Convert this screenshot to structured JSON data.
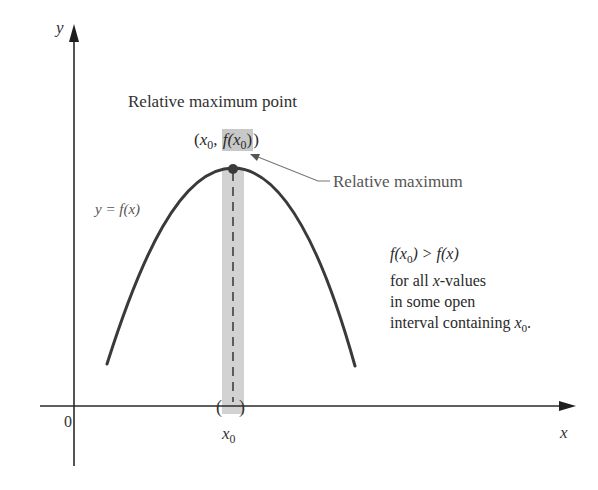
{
  "diagram": {
    "title": "Relative maximum point",
    "point_label": {
      "open": "(",
      "x": "x",
      "x_sub": "0",
      "comma": ",",
      "fx_prefix": "f(x",
      "fx_sub": "0",
      "fx_close": ")",
      "close": ")"
    },
    "annotation": "Relative maximum",
    "function_label": "y = f(x)",
    "condition": {
      "line1_prefix": "f(x",
      "line1_sub": "0",
      "line1_suffix": ") > f(x)",
      "line2_prefix": "for all ",
      "line2_var": "x",
      "line2_suffix": "-values",
      "line3": "in some open",
      "line4_prefix": "interval containing ",
      "line4_var": "x",
      "line4_sub": "0",
      "line4_suffix": "."
    },
    "axes": {
      "x_label": "x",
      "y_label": "y",
      "origin_label": "0",
      "tick_label": "x",
      "tick_sub": "0",
      "interval_marks": "( )"
    },
    "colors": {
      "curve": "#3a3a3a",
      "axis": "#2a2a2a",
      "highlight_band": "#d2d2d2",
      "point_highlight": "#c8c8c8",
      "annotation_arrow": "#777777",
      "annotation_text": "#555555"
    },
    "geometry": {
      "origin_px": [
        74,
        406
      ],
      "peak_px": [
        233,
        168
      ],
      "curve_left_end_px": [
        107,
        364
      ],
      "curve_right_end_px": [
        355,
        366
      ],
      "band_x_range_px": [
        222,
        244
      ]
    }
  }
}
